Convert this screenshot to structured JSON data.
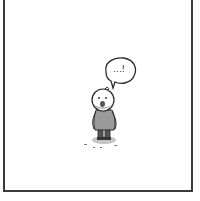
{
  "panel": {
    "border_color": "#3a3a3a",
    "background": "#ffffff"
  },
  "speech_bubble": {
    "text": "…!"
  },
  "character": {
    "body_color": "#9a9a9a",
    "shadow_color": "#bdbdbd"
  }
}
